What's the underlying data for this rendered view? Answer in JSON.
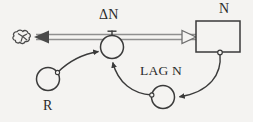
{
  "diagram": {
    "kind": "stock-and-flow-diagram",
    "background_color": "#f4f3f1",
    "stroke_color": "#3a3a3a",
    "pipe_color": "#8a8a8a",
    "fill_color": "#f4f3f1",
    "labels": {
      "flow_delta_n": "ΔN",
      "stock_n": "N",
      "auxiliary_r": "R",
      "auxiliary_lag_n": "LAG N"
    },
    "nodes": [
      {
        "id": "cloud-source",
        "type": "cloud",
        "label": "",
        "cx": 24,
        "cy": 37,
        "rx": 9,
        "ry": 8
      },
      {
        "id": "flow-valve-delta-n",
        "type": "flow-valve",
        "label": "ΔN",
        "cx": 112,
        "cy": 47,
        "r": 11.5
      },
      {
        "id": "stock-n",
        "type": "stock-box",
        "label": "N",
        "x": 196,
        "y": 21,
        "width": 44,
        "height": 31
      },
      {
        "id": "aux-r",
        "type": "auxiliary-circle",
        "label": "R",
        "cx": 48,
        "cy": 79,
        "r": 11.5
      },
      {
        "id": "aux-lag-n",
        "type": "auxiliary-circle",
        "label": "LAG N",
        "cx": 163,
        "cy": 97,
        "r": 11.5
      }
    ],
    "flows": [
      {
        "id": "flow-pipe-delta-n",
        "from": "stock-n",
        "to": "cloud-source",
        "style": "double-line-pipe",
        "left_arrow": "solid",
        "right_arrow": "hollow",
        "y": 37
      }
    ],
    "connectors": [
      {
        "id": "connector-r-to-valve",
        "from": "aux-r",
        "to": "flow-valve-delta-n",
        "arrow": "solid"
      },
      {
        "id": "connector-lag-n-to-valve",
        "from": "aux-lag-n",
        "to": "flow-valve-delta-n",
        "arrow": "solid"
      },
      {
        "id": "connector-stock-n-to-lag-n",
        "from": "stock-n",
        "to": "aux-lag-n",
        "arrow": "solid"
      }
    ]
  }
}
